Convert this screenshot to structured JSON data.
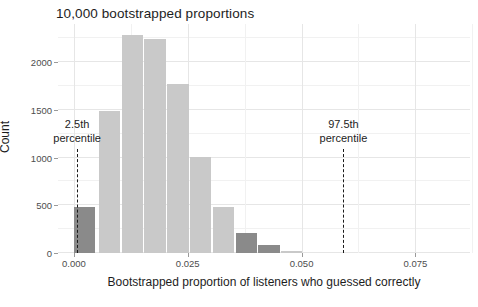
{
  "chart_data": {
    "type": "bar",
    "title": "10,000 bootstrapped proportions",
    "xlabel": "Bootstrapped proportion of listeners who guessed correctly",
    "ylabel": "Count",
    "xlim": [
      -0.0035,
      0.087
    ],
    "ylim": [
      0,
      2400
    ],
    "bin_width": 0.005,
    "grid": true,
    "legend": "none",
    "xticks": [
      {
        "value": 0.0,
        "label": "0.000"
      },
      {
        "value": 0.025,
        "label": "0.025"
      },
      {
        "value": 0.05,
        "label": "0.050"
      },
      {
        "value": 0.075,
        "label": "0.075"
      }
    ],
    "yticks": [
      {
        "value": 0,
        "label": "0"
      },
      {
        "value": 500,
        "label": "500"
      },
      {
        "value": 1000,
        "label": "1000"
      },
      {
        "value": 1500,
        "label": "1500"
      },
      {
        "value": 2000,
        "label": "2000"
      }
    ],
    "bar_color": "#c9c9c9",
    "highlight_color": "#8a8a8a",
    "categories": [
      0.0,
      0.005,
      0.01,
      0.015,
      0.02,
      0.025,
      0.03,
      0.035,
      0.04,
      0.045,
      0.05,
      0.055,
      0.06
    ],
    "values": [
      480,
      1490,
      2290,
      2240,
      1770,
      1010,
      480,
      215,
      85,
      25,
      0,
      0,
      0
    ],
    "bins": [
      {
        "x": 0.0,
        "count": 480,
        "highlight": true
      },
      {
        "x": 0.0055,
        "count": 1490,
        "highlight": false
      },
      {
        "x": 0.0105,
        "count": 2290,
        "highlight": false
      },
      {
        "x": 0.0155,
        "count": 2240,
        "highlight": false
      },
      {
        "x": 0.0205,
        "count": 1770,
        "highlight": false
      },
      {
        "x": 0.0255,
        "count": 1010,
        "highlight": false
      },
      {
        "x": 0.0305,
        "count": 480,
        "highlight": false
      },
      {
        "x": 0.0355,
        "count": 215,
        "highlight": true
      },
      {
        "x": 0.0405,
        "count": 85,
        "highlight": true
      },
      {
        "x": 0.0455,
        "count": 25,
        "highlight": false
      }
    ],
    "annotations": [
      {
        "name": "lower-percentile",
        "line1": "2.5th",
        "line2": "percentile",
        "x": 0.0007
      },
      {
        "name": "upper-percentile",
        "line1": "97.5th",
        "line2": "percentile",
        "x": 0.0592
      }
    ]
  }
}
